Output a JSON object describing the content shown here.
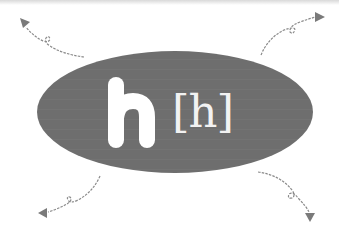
{
  "diagram": {
    "letter": "h",
    "phoneme": "[h]",
    "colors": {
      "ellipse_fill": "#6e6e6e",
      "letter_fill": "#ffffff",
      "phoneme_color": "#f2f2f2",
      "arrow_color": "#7a7a7a",
      "background": "#ffffff"
    },
    "arrows": [
      {
        "name": "arrow-top-left",
        "direction": "up-left"
      },
      {
        "name": "arrow-top-right",
        "direction": "up-right"
      },
      {
        "name": "arrow-bottom-left",
        "direction": "down-left"
      },
      {
        "name": "arrow-bottom-right",
        "direction": "down-right"
      }
    ]
  }
}
